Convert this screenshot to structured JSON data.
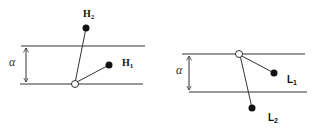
{
  "diagrams": [
    {
      "name": "H-configuration",
      "alpha_label": "α",
      "labels": {
        "upper": "H",
        "upper_sub": "2",
        "lower": "H",
        "lower_sub": "1"
      }
    },
    {
      "name": "L-configuration",
      "alpha_label": "α",
      "labels": {
        "lower_right": "L",
        "lower_right_sub": "1",
        "bottom": "L",
        "bottom_sub": "2"
      }
    }
  ],
  "colors": {
    "line": "#333333",
    "dot": "#111111",
    "open_circle_fill": "#ffffff"
  }
}
